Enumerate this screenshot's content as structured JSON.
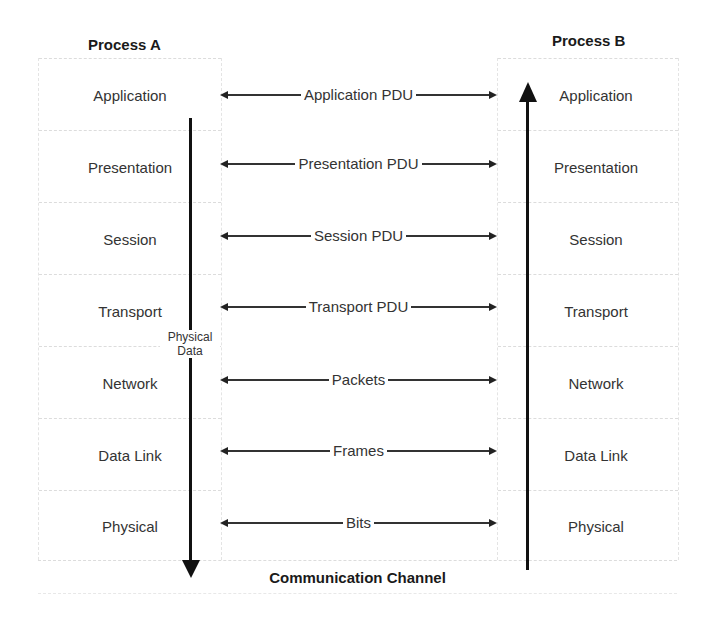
{
  "process_a": {
    "title": "Process A",
    "layers": [
      "Application",
      "Presentation",
      "Session",
      "Transport",
      "Network",
      "Data Link",
      "Physical"
    ]
  },
  "process_b": {
    "title": "Process B",
    "layers": [
      "Application",
      "Presentation",
      "Session",
      "Transport",
      "Network",
      "Data Link",
      "Physical"
    ]
  },
  "pdus": [
    "Application PDU",
    "Presentation PDU",
    "Session PDU",
    "Transport PDU",
    "Packets",
    "Frames",
    "Bits"
  ],
  "down_arrow_label": [
    "Physical",
    "Data"
  ],
  "channel_label": "Communication Channel"
}
